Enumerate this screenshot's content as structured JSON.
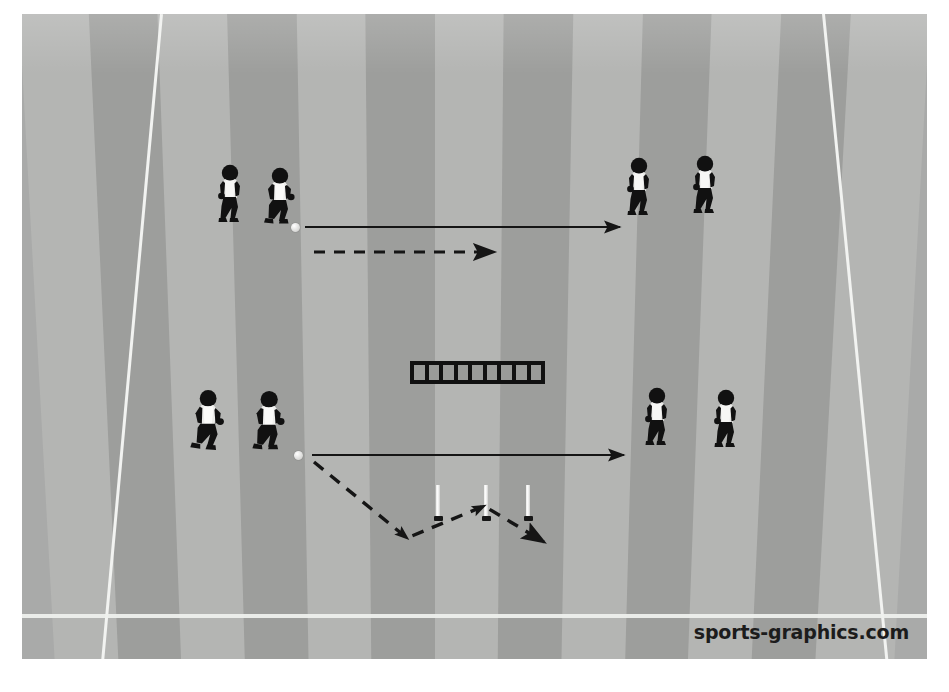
{
  "diagram": {
    "watermark": "sports-graphics.com",
    "surface": {
      "name": "grass-pitch",
      "base_color": "#a9aaa9",
      "stripe_light": "#b4b5b3",
      "stripe_dark": "#9d9e9c",
      "line_color": "#f2f3f1"
    },
    "equipment": {
      "ladder": {
        "label": "agility-ladder",
        "rungs": 9,
        "x": 388,
        "y": 347,
        "width": 135,
        "height": 23,
        "color": "#111111"
      },
      "poles": [
        {
          "label": "slalom-pole-1",
          "x": 412,
          "y": 471
        },
        {
          "label": "slalom-pole-2",
          "x": 460,
          "y": 471
        },
        {
          "label": "slalom-pole-3",
          "x": 502,
          "y": 471
        }
      ],
      "balls": [
        {
          "label": "ball-top",
          "x": 269,
          "y": 209
        },
        {
          "label": "ball-bottom",
          "x": 272,
          "y": 437
        }
      ]
    },
    "players": [
      {
        "label": "player-top-left-1",
        "group": "top-left",
        "pose": "walking",
        "x": 186,
        "y": 149,
        "scale": 1.0
      },
      {
        "label": "player-top-left-2",
        "group": "top-left",
        "pose": "dribbling",
        "x": 234,
        "y": 152,
        "scale": 1.0
      },
      {
        "label": "player-top-right-1",
        "group": "top-right",
        "pose": "walking",
        "x": 595,
        "y": 142,
        "scale": 1.0
      },
      {
        "label": "player-top-right-2",
        "group": "top-right",
        "pose": "walking",
        "x": 661,
        "y": 140,
        "scale": 1.0
      },
      {
        "label": "player-bottom-left-1",
        "group": "bottom-left",
        "pose": "running",
        "x": 162,
        "y": 375,
        "scale": 1.05
      },
      {
        "label": "player-bottom-left-2",
        "group": "bottom-left",
        "pose": "dribbling",
        "x": 222,
        "y": 375,
        "scale": 1.05
      },
      {
        "label": "player-bottom-right-1",
        "group": "bottom-right",
        "pose": "walking",
        "x": 613,
        "y": 372,
        "scale": 1.0
      },
      {
        "label": "player-bottom-right-2",
        "group": "bottom-right",
        "pose": "walking",
        "x": 682,
        "y": 374,
        "scale": 1.0
      }
    ],
    "arrows": [
      {
        "label": "pass-arrow-top",
        "style": "solid",
        "points": "283,213 598,213",
        "description": "pass to the far player"
      },
      {
        "label": "run-arrow-top",
        "style": "dashed",
        "points": "292,238 472,238",
        "description": "supporting run"
      },
      {
        "label": "pass-arrow-bottom",
        "style": "solid",
        "points": "290,441 602,441",
        "description": "pass to the far player"
      },
      {
        "label": "slalom-run-bottom",
        "style": "dashed",
        "points": "292,448 385,524 462,492 522,528",
        "description": "zig-zag slalom run around poles"
      }
    ],
    "legend": {
      "solid_line_meaning": "pass",
      "dashed_line_meaning": "run / movement"
    }
  }
}
